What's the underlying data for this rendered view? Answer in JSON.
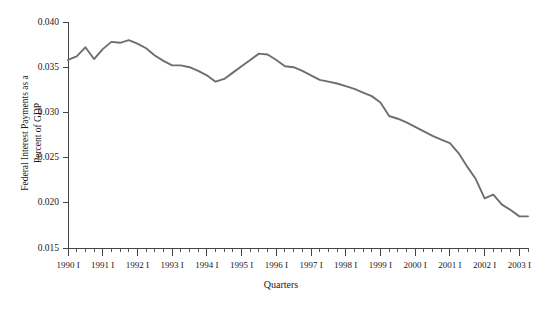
{
  "chart_data": {
    "type": "line",
    "title": "",
    "xlabel": "Quarters",
    "ylabel": "Federal Interest Payments as a Percent of GDP",
    "ylabel_line1": "Federal Interest Payments as a",
    "ylabel_line2": "Percent of GDP",
    "ylim": [
      0.015,
      0.04
    ],
    "ytick_labels": [
      "0.015",
      "0.020",
      "0.025",
      "0.030",
      "0.035",
      "0.040"
    ],
    "ytick_values": [
      0.015,
      0.02,
      0.025,
      0.03,
      0.035,
      0.04
    ],
    "xtick_labels": [
      "1990 I",
      "1991 I",
      "1992 I",
      "1993 I",
      "1994 I",
      "1995 I",
      "1996 I",
      "1997 I",
      "1998 I",
      "1999 I",
      "2000 I",
      "2001 I",
      "2002 I",
      "2003 I"
    ],
    "grid": false,
    "legend": false,
    "line_color": "#6e6e6e",
    "axis_color": "#444444",
    "x": [
      "1990 I",
      "1990 II",
      "1990 III",
      "1990 IV",
      "1991 I",
      "1991 II",
      "1991 III",
      "1991 IV",
      "1992 I",
      "1992 II",
      "1992 III",
      "1992 IV",
      "1993 I",
      "1993 II",
      "1993 III",
      "1993 IV",
      "1994 I",
      "1994 II",
      "1994 III",
      "1994 IV",
      "1995 I",
      "1995 II",
      "1995 III",
      "1995 IV",
      "1996 I",
      "1996 II",
      "1996 III",
      "1996 IV",
      "1997 I",
      "1997 II",
      "1997 III",
      "1997 IV",
      "1998 I",
      "1998 II",
      "1998 III",
      "1998 IV",
      "1999 I",
      "1999 II",
      "1999 III",
      "1999 IV",
      "2000 I",
      "2000 II",
      "2000 III",
      "2000 IV",
      "2001 I",
      "2001 II",
      "2001 III",
      "2001 IV",
      "2002 I",
      "2002 II",
      "2002 III",
      "2002 IV",
      "2003 I",
      "2003 II"
    ],
    "values": [
      0.0358,
      0.0362,
      0.0372,
      0.0359,
      0.037,
      0.0378,
      0.0377,
      0.038,
      0.0376,
      0.0371,
      0.0363,
      0.0357,
      0.0352,
      0.0352,
      0.035,
      0.0346,
      0.0341,
      0.0334,
      0.0337,
      0.0344,
      0.0351,
      0.0358,
      0.0365,
      0.0364,
      0.0358,
      0.0351,
      0.035,
      0.0346,
      0.0341,
      0.0336,
      0.0334,
      0.0332,
      0.0329,
      0.0326,
      0.0322,
      0.0318,
      0.0311,
      0.0296,
      0.0293,
      0.0289,
      0.0284,
      0.0279,
      0.0274,
      0.027,
      0.0266,
      0.0255,
      0.024,
      0.0226,
      0.0205,
      0.0209,
      0.0198,
      0.0192,
      0.0185,
      0.0185
    ]
  }
}
